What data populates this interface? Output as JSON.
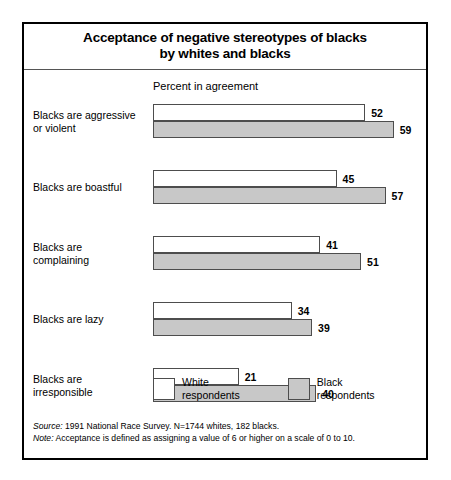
{
  "title": {
    "line1": "Acceptance of negative stereotypes of blacks",
    "line2": "by whites and blacks"
  },
  "axis_caption": "Percent in agreement",
  "legend": [
    {
      "key": "white",
      "label_line1": "White",
      "label_line2": "respondents",
      "swatch_color": "#ffffff"
    },
    {
      "key": "black",
      "label_line1": "Black",
      "label_line2": "respondents",
      "swatch_color": "#c8c8c8"
    }
  ],
  "footnotes": [
    {
      "lead": "Source:",
      "text": " 1991 National Race Survey. N=1744 whites, 182 blacks."
    },
    {
      "lead": "Note:",
      "text": " Acceptance is defined as assigning a value of 6 or higher on a scale of 0 to 10."
    }
  ],
  "chart_data": {
    "type": "bar",
    "orientation": "horizontal",
    "title": "Acceptance of negative stereotypes of blacks by whites and blacks",
    "xlabel": "Percent in agreement",
    "ylabel": "",
    "xlim": [
      0,
      62
    ],
    "grid": false,
    "legend_position": "bottom",
    "categories": [
      "Blacks are aggressive or violent",
      "Blacks are boastful",
      "Blacks are complaining",
      "Blacks are lazy",
      "Blacks are irresponsible"
    ],
    "category_lines": [
      [
        "Blacks are aggressive",
        "or violent"
      ],
      [
        "Blacks are boastful",
        ""
      ],
      [
        "Blacks are",
        "complaining"
      ],
      [
        "Blacks are lazy",
        ""
      ],
      [
        "Blacks are",
        "irresponsible"
      ]
    ],
    "series": [
      {
        "name": "White respondents",
        "color": "#ffffff",
        "values": [
          52,
          45,
          41,
          34,
          21
        ]
      },
      {
        "name": "Black respondents",
        "color": "#c8c8c8",
        "values": [
          59,
          57,
          51,
          39,
          40
        ]
      }
    ]
  }
}
